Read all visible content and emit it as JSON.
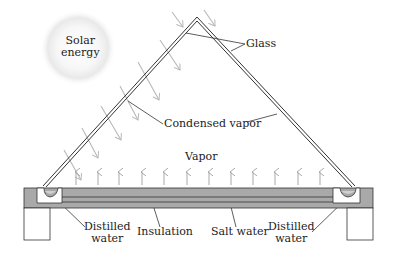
{
  "diagram": {
    "labels": {
      "solar_energy_line1": "Solar",
      "solar_energy_line2": "energy",
      "glass": "Glass",
      "condensed_vapor": "Condensed vapor",
      "vapor": "Vapor",
      "distilled_water_left_line1": "Distilled",
      "distilled_water_left_line2": "water",
      "insulation": "Insulation",
      "salt_water": "Salt water",
      "distilled_water_right_line1": "Distilled",
      "distilled_water_right_line2": "water"
    },
    "colors": {
      "line": "#333333",
      "ray": "#b8b8b8",
      "vapor_arrow": "#b0b0b0",
      "base_fill": "#a9a9a9",
      "sun_glow": "#e6e6e6"
    },
    "components": [
      "sun",
      "glass-cover",
      "incoming-rays",
      "vapor-arrows",
      "salt-water-basin",
      "insulation-layer",
      "distilled-water-troughs",
      "support-legs"
    ]
  }
}
